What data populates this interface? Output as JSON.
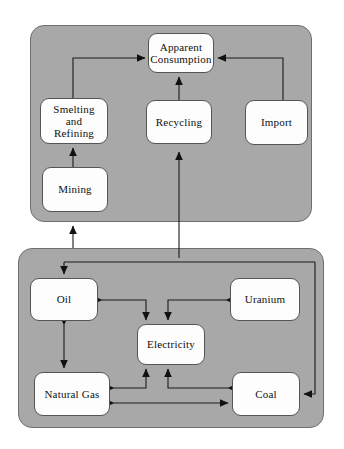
{
  "diagram": {
    "type": "flow-diagram",
    "panels": [
      {
        "id": "materials-panel",
        "name": "materials-cycle-panel",
        "fill": "#a8a8a8",
        "x": 30,
        "y": 25,
        "w": 282,
        "h": 197
      },
      {
        "id": "energy-panel",
        "name": "energy-cycle-panel",
        "fill": "#a8a8a8",
        "x": 18,
        "y": 248,
        "w": 306,
        "h": 180
      }
    ],
    "nodes": [
      {
        "id": "apparent-consumption",
        "label": "Apparent\nConsumption",
        "panel": "materials-panel",
        "x": 148,
        "y": 33,
        "w": 66,
        "h": 40
      },
      {
        "id": "smelting-and-refining",
        "label": "Smelting\nand\nRefining",
        "panel": "materials-panel",
        "x": 40,
        "y": 98,
        "w": 68,
        "h": 46
      },
      {
        "id": "recycling",
        "label": "Recycling",
        "panel": "materials-panel",
        "x": 146,
        "y": 100,
        "w": 66,
        "h": 44
      },
      {
        "id": "import",
        "label": "Import",
        "panel": "materials-panel",
        "x": 245,
        "y": 100,
        "w": 63,
        "h": 45
      },
      {
        "id": "mining",
        "label": "Mining",
        "panel": "materials-panel",
        "x": 42,
        "y": 167,
        "w": 66,
        "h": 45
      },
      {
        "id": "oil",
        "label": "Oil",
        "panel": "energy-panel",
        "x": 30,
        "y": 278,
        "w": 68,
        "h": 43
      },
      {
        "id": "uranium",
        "label": "Uranium",
        "panel": "energy-panel",
        "x": 230,
        "y": 278,
        "w": 70,
        "h": 43
      },
      {
        "id": "electricity",
        "label": "Electricity",
        "panel": "energy-panel",
        "x": 137,
        "y": 324,
        "w": 68,
        "h": 41
      },
      {
        "id": "natural-gas",
        "label": "Natural Gas",
        "panel": "energy-panel",
        "x": 34,
        "y": 372,
        "w": 76,
        "h": 44
      },
      {
        "id": "coal",
        "label": "Coal",
        "panel": "energy-panel",
        "x": 232,
        "y": 372,
        "w": 68,
        "h": 44
      }
    ],
    "edges": [
      {
        "id": "smelting-to-apparent-consumption",
        "from": "smelting-and-refining",
        "to": "apparent-consumption",
        "style": "elbow",
        "arrows": "end"
      },
      {
        "id": "import-to-apparent-consumption",
        "from": "import",
        "to": "apparent-consumption",
        "style": "elbow",
        "arrows": "end"
      },
      {
        "id": "recycling-to-apparent-consumption",
        "from": "recycling",
        "to": "apparent-consumption",
        "style": "straight",
        "arrows": "end"
      },
      {
        "id": "mining-to-smelting",
        "from": "mining",
        "to": "smelting-and-refining",
        "style": "straight",
        "arrows": "end"
      },
      {
        "id": "energy-panel-to-mining",
        "from": "energy-panel",
        "to": "mining",
        "style": "straight",
        "arrows": "end"
      },
      {
        "id": "energy-panel-to-recycling",
        "from": "energy-panel",
        "to": "recycling",
        "style": "straight",
        "arrows": "end"
      },
      {
        "id": "feed-to-oil",
        "from": "energy-panel-bus",
        "to": "oil",
        "style": "elbow",
        "arrows": "end"
      },
      {
        "id": "feed-to-coal",
        "from": "energy-panel-bus",
        "to": "coal",
        "style": "elbow",
        "arrows": "end"
      },
      {
        "id": "electricity-to-oil",
        "from": "electricity",
        "to": "oil",
        "style": "elbow",
        "arrows": "both"
      },
      {
        "id": "electricity-to-uranium",
        "from": "electricity",
        "to": "uranium",
        "style": "elbow",
        "arrows": "both"
      },
      {
        "id": "electricity-to-natural-gas",
        "from": "electricity",
        "to": "natural-gas",
        "style": "elbow",
        "arrows": "both"
      },
      {
        "id": "electricity-to-coal",
        "from": "electricity",
        "to": "coal",
        "style": "elbow",
        "arrows": "both"
      },
      {
        "id": "oil-natural-gas",
        "from": "oil",
        "to": "natural-gas",
        "style": "straight",
        "arrows": "both"
      },
      {
        "id": "natural-gas-coal",
        "from": "natural-gas",
        "to": "coal",
        "style": "straight",
        "arrows": "both"
      }
    ],
    "colors": {
      "panel_fill": "#a8a8a8",
      "panel_border": "#6f6f6f",
      "node_fill": "#fdfdfd",
      "node_border": "#555555",
      "line": "#1a1a1a",
      "background": "#ffffff"
    }
  }
}
